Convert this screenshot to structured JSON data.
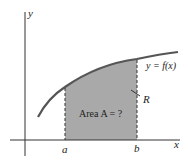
{
  "diagram": {
    "axis_x_label": "x",
    "axis_y_label": "y",
    "curve_label": "y = f(x)",
    "region_label": "R",
    "area_label": "Area A = ?",
    "tick_a": "a",
    "tick_b": "b",
    "colors": {
      "shade": "#a9a9a9",
      "curve": "#555555",
      "axis": "#333333"
    }
  }
}
